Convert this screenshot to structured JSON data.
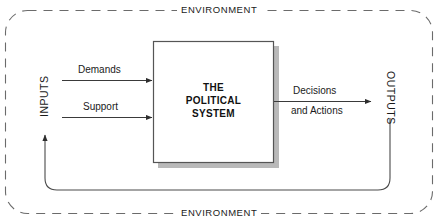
{
  "diagram": {
    "title_top": "ENVIRONMENT",
    "title_bottom": "ENVIRONMENT",
    "system_box": {
      "line1": "THE",
      "line2": "POLITICAL",
      "line3": "SYSTEM"
    },
    "inputs_axis_label": "INPUTS",
    "outputs_axis_label": "OUTPUTS",
    "input_flows": [
      {
        "label": "Demands"
      },
      {
        "label": "Support"
      }
    ],
    "output_flow": {
      "line1": "Decisions",
      "line2": "and Actions"
    },
    "colors": {
      "stroke": "#3a3a3a",
      "box_border": "#555555",
      "box_fill": "#ffffff",
      "box_shadow": "#b9b9b9",
      "text": "#1a1a1a",
      "background": "#ffffff",
      "environment_dash": "#6b6b6b"
    }
  }
}
